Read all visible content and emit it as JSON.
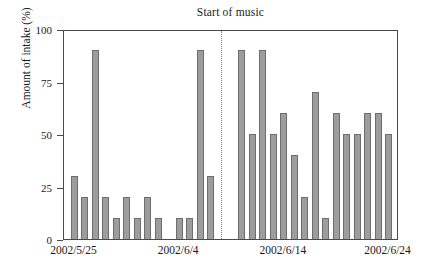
{
  "chart_data": {
    "type": "bar",
    "title": "Start of music",
    "xlabel": "",
    "ylabel": "Amount of intake (%)",
    "ylim": [
      0,
      100
    ],
    "ytick_labels": [
      "100",
      "75",
      "50",
      "25",
      "0"
    ],
    "ytick_values": [
      100,
      75,
      50,
      25,
      0
    ],
    "xtick_labels": [
      "2002/5/25",
      "2002/6/4",
      "2002/6/14",
      "2002/6/24"
    ],
    "xtick_values": [
      "2002/5/25",
      "2002/6/4",
      "2002/6/14",
      "2002/6/24"
    ],
    "grid": false,
    "legend": null,
    "annotations": [
      {
        "label": "Start of music",
        "type": "vertical-dotted-line",
        "x": "2002/6/8"
      }
    ],
    "categories": [
      "2002/5/25",
      "2002/5/26",
      "2002/5/27",
      "2002/5/28",
      "2002/5/29",
      "2002/5/30",
      "2002/5/31",
      "2002/6/1",
      "2002/6/2",
      "2002/6/3",
      "2002/6/4",
      "2002/6/5",
      "2002/6/6",
      "2002/6/7",
      "2002/6/8",
      "2002/6/9",
      "2002/6/10",
      "2002/6/11",
      "2002/6/12",
      "2002/6/13",
      "2002/6/14",
      "2002/6/15",
      "2002/6/16",
      "2002/6/17",
      "2002/6/18",
      "2002/6/19",
      "2002/6/20",
      "2002/6/21",
      "2002/6/22",
      "2002/6/23",
      "2002/6/24"
    ],
    "values": [
      30,
      20,
      90,
      20,
      10,
      20,
      10,
      20,
      10,
      null,
      10,
      10,
      90,
      30,
      null,
      null,
      90,
      50,
      90,
      50,
      60,
      40,
      20,
      70,
      10,
      60,
      50,
      50,
      60,
      60,
      50
    ],
    "bar_color": "#9d9d9d",
    "bar_edge_color": "#6d6d6d"
  }
}
